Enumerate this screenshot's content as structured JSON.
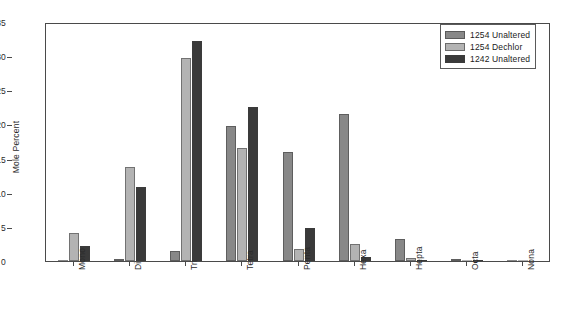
{
  "chart_data": {
    "type": "bar",
    "title": "",
    "xlabel": "",
    "ylabel": "Mole Percent",
    "ylim": [
      0,
      35
    ],
    "yticks": [
      0,
      5,
      10,
      15,
      20,
      25,
      30,
      35
    ],
    "grid": false,
    "legend_position": "top-right",
    "categories": [
      "Mono",
      "Di",
      "Tri",
      "Tetra",
      "Penta",
      "Hexa",
      "Hepta",
      "Octa",
      "Nona"
    ],
    "series": [
      {
        "name": "1254 Unaltered",
        "color": "#888888",
        "values": [
          0.1,
          0.3,
          1.4,
          19.7,
          16.0,
          21.5,
          3.2,
          0.3,
          0.1
        ]
      },
      {
        "name": "1254 Dechlor",
        "color": "#b3b3b3",
        "values": [
          4.1,
          13.7,
          29.8,
          16.5,
          1.7,
          2.5,
          0.5,
          0.2,
          0.1
        ]
      },
      {
        "name": "1242 Unaltered",
        "color": "#3a3a3a",
        "values": [
          2.2,
          10.8,
          32.2,
          22.5,
          4.8,
          0.6,
          0.1,
          0.1,
          0.0
        ]
      }
    ]
  },
  "axis_colors": {
    "frame": "#4a4a4a",
    "text": "#2b2b2b"
  }
}
